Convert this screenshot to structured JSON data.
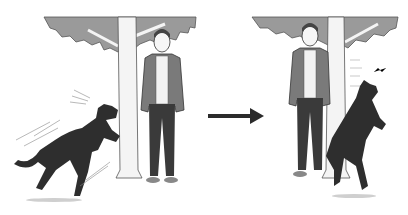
{
  "illustration": {
    "description": "Two-panel illustration: a dog barks and lunges at a tree near a man, then an arrow points to the second panel where the man stands by the tree and the dog jumps up against the trunk.",
    "panels": [
      {
        "id": "left",
        "subject": "dog barking at tree beside standing man"
      },
      {
        "id": "right",
        "subject": "dog jumping on tree, man standing beside tree"
      }
    ],
    "arrow": {
      "direction": "right"
    },
    "colors": {
      "canopy": "#9a9a9a",
      "canopy_outline": "#555555",
      "trunk": "#f4f4f4",
      "jacket": "#7a7a7a",
      "pants": "#3a3a3a",
      "shirt": "#f2f2f2",
      "dog": "#2e2e2e",
      "arrow": "#2b2b2b",
      "shadow": "#cfcfcf"
    }
  }
}
